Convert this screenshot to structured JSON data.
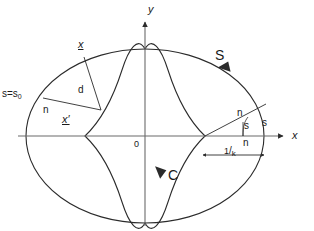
{
  "figure": {
    "background_color": "#ffffff",
    "stroke_color": "#2b2b2b",
    "axis_color": "#6b6b6b",
    "width": 314,
    "height": 231
  },
  "axes": {
    "x_label": "x",
    "y_label": "y",
    "origin_label": "0",
    "origin_px": {
      "x": 145,
      "y": 136
    }
  },
  "labels": {
    "outer_curve": "S",
    "inner_curve": "C",
    "arc_start": "s=s",
    "arc_start_sub": "0",
    "point_x": "x",
    "point_x_prime": "x′",
    "distance": "d",
    "normal_left": "n",
    "normal_right_top": "n",
    "normal_right_bottom": "n",
    "arclength_right_outer": "s",
    "arclength_right_inner": "s",
    "radius_numerator": "1",
    "radius_slash": "/",
    "radius_denominator": "k"
  },
  "geometry": {
    "ellipse": {
      "cx": 145,
      "cy": 136,
      "rx": 119,
      "ry": 87
    },
    "astroid": {
      "cx": 145,
      "cy": 136,
      "ax": 60,
      "ay": 87
    },
    "x_axis": {
      "x1": 26,
      "y1": 136,
      "x2": 286,
      "y2": 136
    },
    "y_axis": {
      "x1": 145,
      "y1": 214,
      "x2": 145,
      "y2": 18
    },
    "point_x": {
      "x": 84,
      "y": 55
    },
    "point_x_prime": {
      "x": 101,
      "y": 112
    },
    "arc_start_point": {
      "x": 41,
      "y": 96
    },
    "right_normal_tip": {
      "x": 265,
      "y": 104
    },
    "right_foot": {
      "x": 205,
      "y": 136
    },
    "arrow_left": {
      "x": 205,
      "y": 155
    },
    "arrow_right": {
      "x": 262,
      "y": 155
    }
  }
}
